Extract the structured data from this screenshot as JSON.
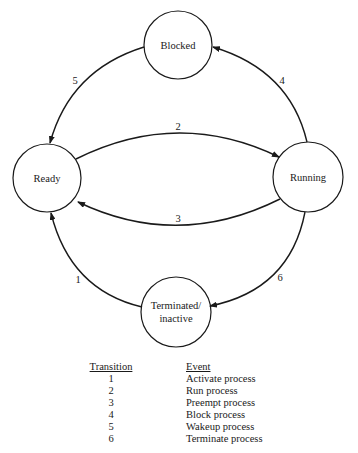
{
  "diagram": {
    "nodes": {
      "blocked": {
        "label": "Blocked",
        "cx": 178,
        "cy": 45,
        "r": 34
      },
      "ready": {
        "label": "Ready",
        "cx": 47,
        "cy": 178,
        "r": 34
      },
      "running": {
        "label": "Running",
        "cx": 308,
        "cy": 177,
        "r": 35
      },
      "terminated": {
        "label_line1": "Terminated/",
        "label_line2": "inactive",
        "cx": 176,
        "cy": 312,
        "r": 35
      }
    },
    "edges": {
      "e1": {
        "label": "1",
        "from": "Terminated/inactive",
        "to": "Ready"
      },
      "e2": {
        "label": "2",
        "from": "Ready",
        "to": "Running"
      },
      "e3": {
        "label": "3",
        "from": "Running",
        "to": "Ready"
      },
      "e4": {
        "label": "4",
        "from": "Running",
        "to": "Blocked"
      },
      "e5": {
        "label": "5",
        "from": "Blocked",
        "to": "Ready"
      },
      "e6": {
        "label": "6",
        "from": "Running",
        "to": "Terminated/inactive"
      }
    }
  },
  "legend": {
    "transition_header": "Transition",
    "event_header": "Event",
    "rows": [
      {
        "transition": "1",
        "event": "Activate process"
      },
      {
        "transition": "2",
        "event": "Run process"
      },
      {
        "transition": "3",
        "event": "Preempt process"
      },
      {
        "transition": "4",
        "event": "Block process"
      },
      {
        "transition": "5",
        "event": "Wakeup process"
      },
      {
        "transition": "6",
        "event": "Terminate process"
      }
    ]
  }
}
